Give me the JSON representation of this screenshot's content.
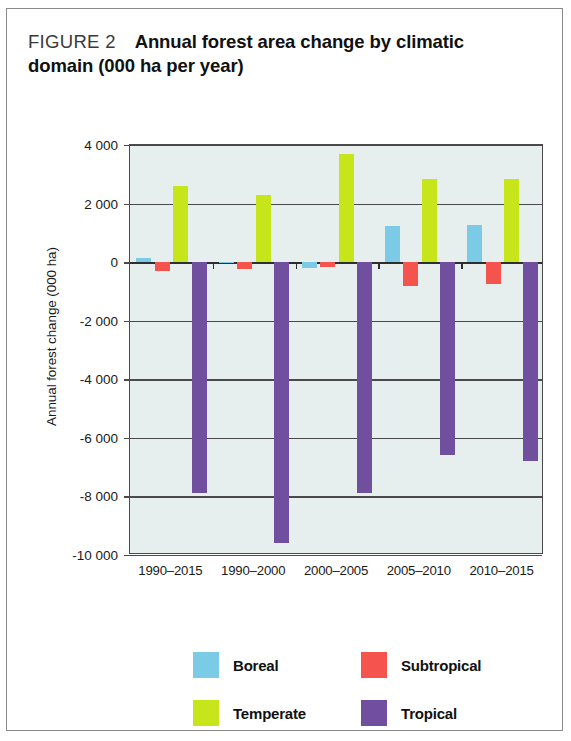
{
  "figure": {
    "label": "FIGURE 2",
    "title_line1": "Annual forest area change by climatic",
    "title_line2": "domain (000 ha per year)"
  },
  "colors": {
    "boreal": "#7ccbe6",
    "subtropical": "#f4534e",
    "temperate": "#c6e51b",
    "tropical": "#6f4f9e",
    "plot_background": "#e7eeee",
    "axis": "#4a4a4a",
    "frame": "#8a8a8a"
  },
  "legend": {
    "position": "bottom",
    "rows": [
      [
        {
          "label": "Boreal",
          "color_key": "boreal"
        },
        {
          "label": "Subtropical",
          "color_key": "subtropical"
        }
      ],
      [
        {
          "label": "Temperate",
          "color_key": "temperate"
        },
        {
          "label": "Tropical",
          "color_key": "tropical"
        }
      ]
    ]
  },
  "chart_data": {
    "type": "bar",
    "title": "FIGURE 2 Annual forest area change by climatic domain (000 ha per year)",
    "xlabel": "",
    "ylabel": "Annual forest change (000 ha)",
    "ylim": [
      -10000,
      4000
    ],
    "ytick_labels": [
      "4 000",
      "2 000",
      "0",
      "-2 000",
      "-4 000",
      "-6 000",
      "-8 000",
      "-10 000"
    ],
    "ytick_values": [
      4000,
      2000,
      0,
      -2000,
      -4000,
      -6000,
      -8000,
      -10000
    ],
    "grid": true,
    "categories": [
      "1990–2015",
      "1990–2000",
      "2000–2005",
      "2005–2010",
      "2010–2015"
    ],
    "series": [
      {
        "name": "Boreal",
        "color_key": "boreal",
        "values": [
          155,
          20,
          -190,
          1250,
          1270
        ]
      },
      {
        "name": "Subtropical",
        "color_key": "subtropical",
        "values": [
          -300,
          -250,
          -180,
          -800,
          -760
        ]
      },
      {
        "name": "Temperate",
        "color_key": "temperate",
        "values": [
          2600,
          2300,
          3700,
          2850,
          2850
        ]
      },
      {
        "name": "Tropical",
        "color_key": "tropical",
        "values": [
          -7900,
          -9600,
          -7900,
          -6600,
          -6800
        ]
      }
    ]
  }
}
